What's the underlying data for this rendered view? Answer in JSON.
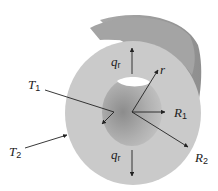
{
  "diagram": {
    "labels": {
      "T1": {
        "main": "T",
        "sub": "1"
      },
      "T2": {
        "main": "T",
        "sub": "2"
      },
      "R1": {
        "main": "R",
        "sub": "1"
      },
      "R2": {
        "main": "R",
        "sub": "2"
      },
      "r": {
        "main": "r"
      },
      "qr_top": {
        "main": "q",
        "sub": "r"
      },
      "qr_bottom": {
        "main": "q",
        "sub": "r"
      }
    },
    "colors": {
      "face": "#c9c9c9",
      "side": "#9e9e9e",
      "inner": "#a8a8a8",
      "hole": "#ffffff",
      "arrow": "#222222"
    }
  }
}
